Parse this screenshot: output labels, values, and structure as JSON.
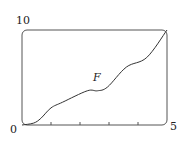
{
  "chart_data": {
    "type": "line",
    "title": "",
    "xlabel": "",
    "ylabel": "",
    "xlim": [
      0,
      5
    ],
    "ylim": [
      0,
      10
    ],
    "x_tick_labels": [
      "0",
      "5"
    ],
    "y_tick_labels": [
      "10"
    ],
    "x_minor_ticks": [
      1,
      2,
      3,
      4
    ],
    "grid": false,
    "legend": null,
    "annotations": [
      {
        "text": "F",
        "x": 2.55,
        "y": 5.0
      }
    ],
    "series": [
      {
        "name": "F",
        "x": [
          0,
          0.4,
          0.65,
          1.0,
          1.4,
          2.25,
          2.6,
          2.95,
          3.6,
          4.3,
          5.0
        ],
        "values": [
          0,
          0.2,
          0.7,
          1.8,
          2.4,
          3.6,
          3.6,
          4.0,
          6.1,
          7.1,
          10.0
        ]
      }
    ]
  },
  "labels": {
    "origin": "0",
    "x_max": "5",
    "y_max": "10",
    "curve": "F"
  }
}
